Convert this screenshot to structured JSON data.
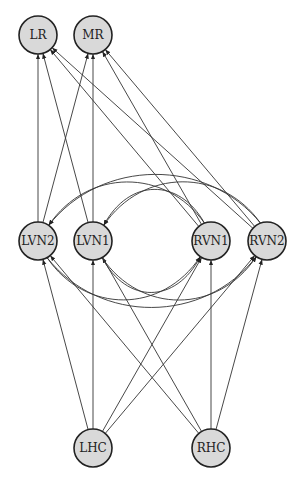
{
  "diagram": {
    "type": "directed-graph",
    "nodes": [
      {
        "id": "LR",
        "label": "LR",
        "x": 38,
        "y": 35
      },
      {
        "id": "MR",
        "label": "MR",
        "x": 93,
        "y": 35
      },
      {
        "id": "LVN2",
        "label": "LVN2",
        "x": 38,
        "y": 241
      },
      {
        "id": "LVN1",
        "label": "LVN1",
        "x": 93,
        "y": 241
      },
      {
        "id": "RVN1",
        "label": "RVN1",
        "x": 211,
        "y": 241
      },
      {
        "id": "RVN2",
        "label": "RVN2",
        "x": 267,
        "y": 241
      },
      {
        "id": "LHC",
        "label": "LHC",
        "x": 93,
        "y": 448
      },
      {
        "id": "RHC",
        "label": "RHC",
        "x": 211,
        "y": 448
      }
    ],
    "edges": [
      {
        "from": "LHC",
        "to": "LVN2"
      },
      {
        "from": "LHC",
        "to": "LVN1"
      },
      {
        "from": "LHC",
        "to": "RVN1"
      },
      {
        "from": "LHC",
        "to": "RVN2"
      },
      {
        "from": "RHC",
        "to": "LVN2"
      },
      {
        "from": "RHC",
        "to": "LVN1"
      },
      {
        "from": "RHC",
        "to": "RVN1"
      },
      {
        "from": "RHC",
        "to": "RVN2"
      },
      {
        "from": "LVN2",
        "to": "LR"
      },
      {
        "from": "LVN2",
        "to": "MR"
      },
      {
        "from": "LVN1",
        "to": "LR"
      },
      {
        "from": "LVN1",
        "to": "MR"
      },
      {
        "from": "RVN1",
        "to": "LR"
      },
      {
        "from": "RVN1",
        "to": "MR"
      },
      {
        "from": "RVN2",
        "to": "LR"
      },
      {
        "from": "RVN2",
        "to": "MR"
      },
      {
        "from": "RVN1",
        "to": "LVN2",
        "curve": "upper"
      },
      {
        "from": "RVN1",
        "to": "LVN1",
        "curve": "upper"
      },
      {
        "from": "RVN2",
        "to": "LVN2",
        "curve": "upper"
      },
      {
        "from": "RVN2",
        "to": "LVN1",
        "curve": "upper"
      },
      {
        "from": "LVN2",
        "to": "RVN1",
        "curve": "lower"
      },
      {
        "from": "LVN2",
        "to": "RVN2",
        "curve": "lower"
      },
      {
        "from": "LVN1",
        "to": "RVN1",
        "curve": "lower"
      },
      {
        "from": "LVN1",
        "to": "RVN2",
        "curve": "lower"
      }
    ],
    "node_fill": "#d9d9d9",
    "node_stroke": "#222222",
    "edge_color": "#333333"
  }
}
